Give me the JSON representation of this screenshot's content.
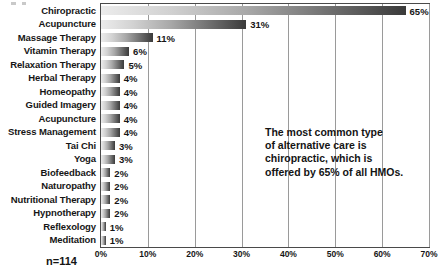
{
  "chart_data": {
    "type": "bar",
    "orientation": "horizontal",
    "title": "",
    "xlabel": "",
    "ylabel": "",
    "xlim": [
      0,
      70
    ],
    "grid": true,
    "legend": false,
    "xtick_labels": [
      "0%",
      "10%",
      "20%",
      "30%",
      "40%",
      "50%",
      "60%",
      "70%"
    ],
    "xtick_values": [
      0,
      10,
      20,
      30,
      40,
      50,
      60,
      70
    ],
    "categories": [
      "Chiropractic",
      "Acupuncture",
      "Massage Therapy",
      "Vitamin Therapy",
      "Relaxation Therapy",
      "Herbal Therapy",
      "Homeopathy",
      "Guided Imagery",
      "Acupuncture",
      "Stress Management",
      "Tai Chi",
      "Yoga",
      "Biofeedback",
      "Naturopathy",
      "Nutritional Therapy",
      "Hypnotherapy",
      "Reflexology",
      "Meditation"
    ],
    "values": [
      65,
      31,
      11,
      6,
      5,
      4,
      4,
      4,
      4,
      4,
      3,
      3,
      2,
      2,
      2,
      2,
      1,
      1
    ],
    "value_labels": [
      "65%",
      "31%",
      "11%",
      "6%",
      "5%",
      "4%",
      "4%",
      "4%",
      "4%",
      "4%",
      "3%",
      "3%",
      "2%",
      "2%",
      "2%",
      "2%",
      "1%",
      "1%"
    ],
    "annotation": "The most common type of alternative care is chiropractic, which is offered by 65% of all HMOs.",
    "annotation_lines": [
      "The most common type",
      "of alternative care is",
      "chiropractic, which is",
      "offered by 65% of all HMOs."
    ],
    "sample_note": "n=114",
    "colors": {
      "bar_gradient_start": "#ececec",
      "bar_gradient_end": "#3a3a3a",
      "gridline": "#9a9a9a",
      "axis_border": "#4a4a4a",
      "text": "#161616",
      "background": "#ffffff"
    }
  }
}
